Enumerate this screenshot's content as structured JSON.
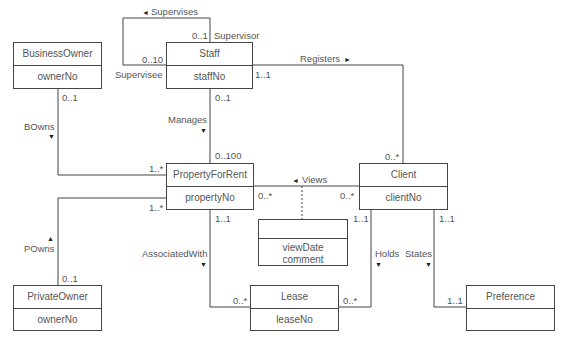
{
  "diagram": {
    "type": "UML class diagram",
    "colors": {
      "line": "#444444",
      "text": "#555555",
      "background": "#ffffff"
    },
    "classes": [
      {
        "id": "business_owner",
        "name": "BusinessOwner",
        "attributes": [
          "ownerNo"
        ]
      },
      {
        "id": "staff",
        "name": "Staff",
        "attributes": [
          "staffNo"
        ]
      },
      {
        "id": "property_for_rent",
        "name": "PropertyForRent",
        "attributes": [
          "propertyNo"
        ]
      },
      {
        "id": "client",
        "name": "Client",
        "attributes": [
          "clientNo"
        ]
      },
      {
        "id": "views_assoc_class",
        "name": "",
        "attributes": [
          "viewDate",
          "comment"
        ]
      },
      {
        "id": "lease",
        "name": "Lease",
        "attributes": [
          "leaseNo"
        ]
      },
      {
        "id": "private_owner",
        "name": "PrivateOwner",
        "attributes": [
          "ownerNo"
        ]
      },
      {
        "id": "preference",
        "name": "Preference",
        "attributes": []
      }
    ],
    "associations": {
      "supervises": {
        "label": "Supervises",
        "arrow": "◄",
        "supervisor_role": "Supervisor",
        "supervisor_mult": "0..1",
        "supervisee_role": "Supervisee",
        "supervisee_mult": "0..10"
      },
      "registers": {
        "label": "Registers",
        "arrow": "►",
        "staff_mult": "1..1",
        "client_mult": "0..*"
      },
      "manages": {
        "label": "Manages",
        "arrow": "▼",
        "staff_mult": "0..1",
        "property_mult": "0..100"
      },
      "bowns": {
        "label": "BOwns",
        "arrow": "▼",
        "owner_mult": "0..1",
        "property_mult": "1..*"
      },
      "powns": {
        "label": "POwns",
        "arrow": "▲",
        "owner_mult": "0..1",
        "property_mult": "1..*"
      },
      "views": {
        "label": "Views",
        "arrow": "◄",
        "property_mult": "0..*",
        "client_mult": "0..*"
      },
      "associated_with": {
        "label": "AssociatedWith",
        "arrow": "▼",
        "property_mult": "1..1",
        "lease_mult": "0..*"
      },
      "holds": {
        "label": "Holds",
        "arrow": "▼",
        "client_mult": "1..1",
        "lease_mult": "0..*"
      },
      "states": {
        "label": "States",
        "arrow": "▼",
        "client_mult": "1..1",
        "preference_mult": "1..1"
      }
    }
  }
}
